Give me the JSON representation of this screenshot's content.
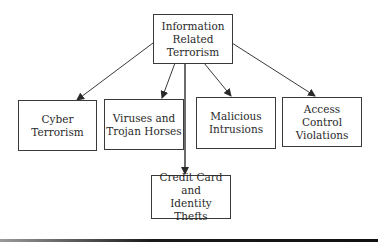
{
  "diagram": {
    "root": {
      "label": "Information\nRelated\nTerrorism"
    },
    "children": [
      {
        "label": "Cyber\nTerrorism"
      },
      {
        "label": "Viruses and\nTrojan Horses"
      },
      {
        "label": "Malicious\nIntrusions"
      },
      {
        "label": "Access Control\nViolations"
      },
      {
        "label": "Credit Card and\nIdentity Thefts"
      }
    ],
    "edges": [
      {
        "from": "Information Related Terrorism",
        "to": "Cyber Terrorism"
      },
      {
        "from": "Information Related Terrorism",
        "to": "Viruses and Trojan Horses"
      },
      {
        "from": "Information Related Terrorism",
        "to": "Malicious Intrusions"
      },
      {
        "from": "Information Related Terrorism",
        "to": "Access Control Violations"
      },
      {
        "from": "Information Related Terrorism",
        "to": "Credit Card and Identity Thefts"
      }
    ],
    "colors": {
      "line": "#3a3a3a",
      "text": "#2a2a2a",
      "background": "#ffffff"
    }
  }
}
